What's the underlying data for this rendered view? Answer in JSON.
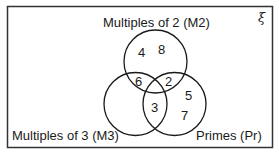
{
  "diagram": {
    "type": "venn",
    "universal_symbol": "ξ",
    "sets": [
      {
        "id": "M2",
        "label": "Multiples of 2 (M2)"
      },
      {
        "id": "M3",
        "label": "Multiples of 3 (M3)"
      },
      {
        "id": "Pr",
        "label": "Primes (Pr)"
      }
    ],
    "regions": {
      "M2_only": [
        "4",
        "8"
      ],
      "M2_M3": [
        "6"
      ],
      "M2_Pr": [
        "2"
      ],
      "M3_Pr": [
        "3"
      ],
      "Pr_only": [
        "5",
        "7"
      ],
      "M3_only": [],
      "all_three": [],
      "outside": []
    },
    "colors": {
      "stroke": "#1a1a1a",
      "background": "#ffffff"
    }
  }
}
